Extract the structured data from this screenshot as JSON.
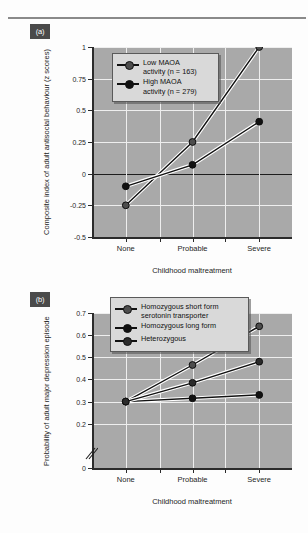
{
  "figure": {
    "panel_a_label": "(a)",
    "panel_b_label": "(b)"
  },
  "chart_data": [
    {
      "type": "line",
      "panel": "(a)",
      "title": "",
      "xlabel": "Childhood maltreatment",
      "ylabel": "Composite index of adult antisocial behaviour (z scores)",
      "categories": [
        "None",
        "Probable",
        "Severe"
      ],
      "yticks": [
        "-0.5",
        "-0.25",
        "0",
        "0.25",
        "0.5",
        "0.75",
        "1"
      ],
      "ytick_values": [
        -0.5,
        -0.25,
        0,
        0.25,
        0.5,
        0.75,
        1
      ],
      "ylim": [
        -0.5,
        1
      ],
      "grid": true,
      "legend_position": "top-left",
      "series": [
        {
          "name": "Low MAOA activity (n = 163)",
          "label_line1": "Low MAOA",
          "label_line2": "activity (n = 163)",
          "marker_color": "#4d4d4d",
          "values": [
            -0.25,
            0.25,
            1.0
          ]
        },
        {
          "name": "High MAOA activity (n = 279)",
          "label_line1": "High MAOA",
          "label_line2": "activity (n = 279)",
          "marker_color": "#111111",
          "values": [
            -0.1,
            0.07,
            0.41
          ]
        }
      ]
    },
    {
      "type": "line",
      "panel": "(b)",
      "title": "",
      "xlabel": "Childhood maltreatment",
      "ylabel": "Probability of adult major depression episode",
      "categories": [
        "None",
        "Probable",
        "Severe"
      ],
      "yticks": [
        "0",
        "0.2",
        "0.3",
        "0.4",
        "0.5",
        "0.6",
        "0.7"
      ],
      "ytick_values": [
        0,
        0.2,
        0.3,
        0.4,
        0.5,
        0.6,
        0.7
      ],
      "ylim": [
        0,
        0.7
      ],
      "axis_break": "between 0 and 0.2",
      "grid": true,
      "legend_position": "top-left",
      "series": [
        {
          "name": "Homozygous short form serotonin transporter",
          "label_line1": "Homozygous short form",
          "label_line2": "serotonin transporter",
          "marker_color": "#4d4d4d",
          "values": [
            0.3,
            0.465,
            0.64
          ]
        },
        {
          "name": "Homozygous long form",
          "label_line1": "Homozygous long form",
          "label_line2": "",
          "marker_color": "#111111",
          "values": [
            0.3,
            0.315,
            0.33
          ]
        },
        {
          "name": "Heterozygous",
          "label_line1": "Heterozygous",
          "label_line2": "",
          "marker_color": "#2b2b2b",
          "values": [
            0.3,
            0.385,
            0.48
          ]
        }
      ]
    }
  ]
}
